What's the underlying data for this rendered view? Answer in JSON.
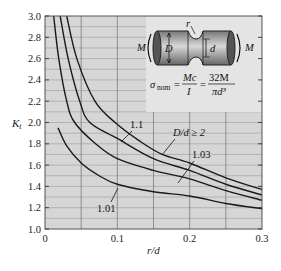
{
  "chart_data": {
    "type": "line",
    "title": "",
    "xlabel": "r/d",
    "ylabel": "K_t",
    "xlim": [
      0,
      0.3
    ],
    "ylim": [
      1.0,
      3.0
    ],
    "grid": true,
    "x_ticks": [
      "0",
      "0.1",
      "0.2",
      "0.3"
    ],
    "x_tick_values": [
      0,
      0.1,
      0.2,
      0.3
    ],
    "y_ticks": [
      "1.0",
      "1.2",
      "1.4",
      "1.6",
      "1.8",
      "2.0",
      "2.2",
      "2.4",
      "2.6",
      "2.8",
      "3.0"
    ],
    "y_tick_values": [
      1.0,
      1.2,
      1.4,
      1.6,
      1.8,
      2.0,
      2.2,
      2.4,
      2.6,
      2.8,
      3.0
    ],
    "series": [
      {
        "name": "D/d ≥ 2",
        "label": "D/d ≥ 2",
        "x": [
          0.03,
          0.044,
          0.069,
          0.097,
          0.13,
          0.162,
          0.2,
          0.25,
          0.3
        ],
        "y": [
          3.0,
          2.6,
          2.2,
          2.0,
          1.83,
          1.7,
          1.62,
          1.48,
          1.37
        ]
      },
      {
        "name": "1.1",
        "label": "1.1",
        "x": [
          0.021,
          0.032,
          0.048,
          0.062,
          0.1,
          0.15,
          0.2,
          0.25,
          0.3
        ],
        "y": [
          3.0,
          2.6,
          2.2,
          2.0,
          1.85,
          1.66,
          1.55,
          1.42,
          1.32
        ]
      },
      {
        "name": "1.03",
        "label": "1.03",
        "x": [
          0.012,
          0.019,
          0.03,
          0.041,
          0.07,
          0.1,
          0.15,
          0.2,
          0.25,
          0.3
        ],
        "y": [
          3.0,
          2.6,
          2.2,
          2.0,
          1.8,
          1.66,
          1.55,
          1.47,
          1.36,
          1.27
        ]
      },
      {
        "name": "1.01",
        "label": "1.01",
        "x": [
          0.018,
          0.03,
          0.05,
          0.075,
          0.1,
          0.15,
          0.2,
          0.25,
          0.3
        ],
        "y": [
          1.95,
          1.78,
          1.62,
          1.5,
          1.42,
          1.35,
          1.31,
          1.24,
          1.19
        ]
      }
    ],
    "annotations": [
      {
        "text": "1.1",
        "x": 0.105,
        "y": 1.95
      },
      {
        "text": "D/d ≥ 2",
        "x": 0.17,
        "y": 1.85
      },
      {
        "text": "1.03",
        "x": 0.2,
        "y": 1.66
      },
      {
        "text": "1.01",
        "x": 0.08,
        "y": 1.22
      }
    ],
    "inset": {
      "moment_label": "M",
      "large_diameter_label": "D",
      "small_diameter_label": "d",
      "radius_label": "r",
      "formula": "σ_nom = Mc/I = 32M/(πd³)",
      "formula_parts": {
        "sigma": "σ",
        "sub": "nom",
        "eq": "=",
        "n1": "Mc",
        "d1": "I",
        "n2": "32M",
        "d2": "πd³"
      }
    }
  },
  "colors": {
    "plot_bg": "#d6d6d6",
    "grid_major": "#7a7a7a",
    "grid_minor": "#9a9a9a",
    "curve": "#1a1a1a",
    "shaft": "#9a9a9a"
  }
}
